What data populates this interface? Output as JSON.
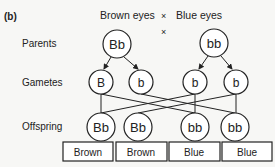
{
  "figure_label": "(b)",
  "header": {
    "left": "Brown eyes",
    "cross": "×",
    "right": "Blue eyes"
  },
  "cross_symbol": "×",
  "rows": {
    "parents": "Parents",
    "gametes": "Gametes",
    "offspring": "Offspring"
  },
  "parents": [
    {
      "genotype": "Bb",
      "phenotype": "Brown eyes"
    },
    {
      "genotype": "bb",
      "phenotype": "Blue eyes"
    }
  ],
  "gametes": [
    {
      "allele": "B",
      "from": "Bb"
    },
    {
      "allele": "b",
      "from": "Bb"
    },
    {
      "allele": "b",
      "from": "bb"
    },
    {
      "allele": "b",
      "from": "bb"
    }
  ],
  "offspring": [
    {
      "genotype": "Bb",
      "phenotype": "Brown"
    },
    {
      "genotype": "Bb",
      "phenotype": "Brown"
    },
    {
      "genotype": "bb",
      "phenotype": "Blue"
    },
    {
      "genotype": "bb",
      "phenotype": "Blue"
    }
  ],
  "colors": {
    "stroke": "#222222",
    "background": "#f7f7f5"
  }
}
